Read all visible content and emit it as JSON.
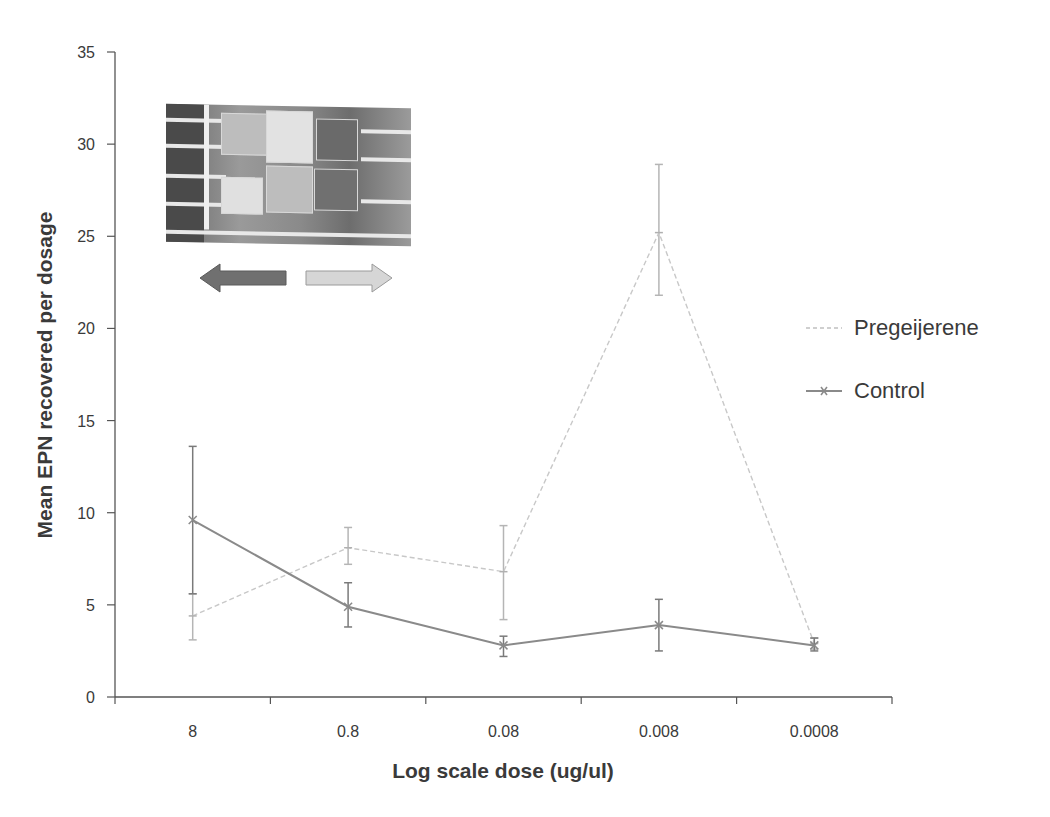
{
  "chart_data": {
    "type": "line",
    "title": "",
    "xlabel": "Log scale dose (ug/ul)",
    "ylabel": "Mean EPN recovered per dosage",
    "categories": [
      "8",
      "0.8",
      "0.08",
      "0.008",
      "0.0008"
    ],
    "ylim": [
      0,
      35
    ],
    "yticks": [
      0,
      5,
      10,
      15,
      20,
      25,
      30,
      35
    ],
    "grid": false,
    "legend_position": "right",
    "series": [
      {
        "name": "Pregeijerene",
        "color": "#c8c8c8",
        "marker": "dash",
        "values": [
          4.4,
          8.1,
          6.8,
          25.2,
          2.9
        ],
        "error_upper": [
          5.6,
          9.2,
          9.3,
          28.9,
          3.2
        ],
        "error_lower": [
          3.1,
          7.2,
          4.2,
          21.8,
          2.6
        ]
      },
      {
        "name": "Control",
        "color": "#8a8a8a",
        "marker": "x",
        "values": [
          9.6,
          4.9,
          2.8,
          3.9,
          2.8
        ],
        "error_upper": [
          13.6,
          6.2,
          3.3,
          5.3,
          3.2
        ],
        "error_lower": [
          5.6,
          3.8,
          2.2,
          2.5,
          2.5
        ]
      }
    ],
    "annotations": [
      "inset photograph of experimental arena",
      "left arrow (dark)",
      "right arrow (light)"
    ]
  },
  "legend": {
    "items": [
      {
        "label": "Pregeijerene"
      },
      {
        "label": "Control"
      }
    ]
  },
  "axes": {
    "x_title": "Log scale dose (ug/ul)",
    "y_title": "Mean EPN recovered per dosage"
  }
}
